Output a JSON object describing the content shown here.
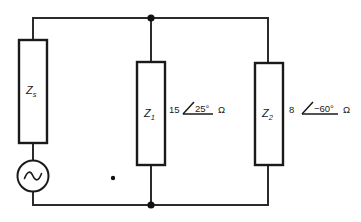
{
  "diagram": {
    "background_color": "#ffffff",
    "line_color": "#2b2b2b"
  },
  "components": {
    "source_impedance": {
      "label": "Z",
      "subscript": "s",
      "name": "source-impedance"
    },
    "ac_source": {
      "symbol": "~",
      "name": "ac-voltage-source"
    },
    "branch1": {
      "label": "Z",
      "subscript": "1",
      "magnitude": "15",
      "angle": "25°",
      "unit": "Ω"
    },
    "branch2": {
      "label": "Z",
      "subscript": "2",
      "magnitude": "8",
      "angle": "−60°",
      "unit": "Ω"
    }
  },
  "nodes": {
    "top_junction": "node-top",
    "bottom_junction": "node-bottom",
    "reference_dot": "reference-dot"
  }
}
